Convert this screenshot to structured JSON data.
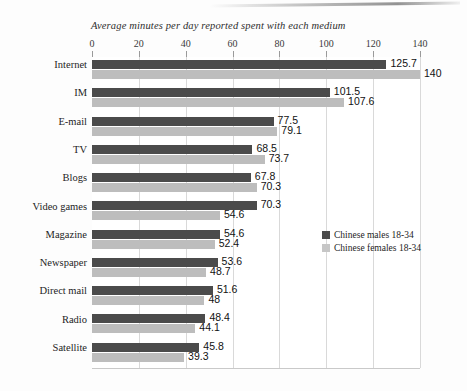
{
  "chart_data": {
    "type": "bar",
    "orientation": "horizontal",
    "title": "Average minutes per day reported spent with each medium",
    "xlabel": "",
    "ylabel": "",
    "xlim": [
      0,
      140
    ],
    "xticks": [
      0,
      20,
      40,
      60,
      80,
      100,
      120,
      140
    ],
    "grid": true,
    "legend_position": "center-right",
    "categories": [
      "Internet",
      "IM",
      "E-mail",
      "TV",
      "Blogs",
      "Video games",
      "Magazine",
      "Newspaper",
      "Direct mail",
      "Radio",
      "Satellite"
    ],
    "series": [
      {
        "name": "Chinese males 18-34",
        "color": "#4b4b4b",
        "values": [
          125.7,
          101.5,
          77.5,
          68.5,
          67.8,
          70.3,
          54.6,
          53.6,
          51.6,
          48.4,
          45.8
        ],
        "labels": [
          "125.7",
          "101.5",
          "77.5",
          "68.5",
          "67.8",
          "70.3",
          "54.6",
          "53.6",
          "51.6",
          "48.4",
          "45.8"
        ]
      },
      {
        "name": "Chinese females  18-34",
        "color": "#bdbdbd",
        "values": [
          140,
          107.6,
          79.1,
          73.7,
          70.3,
          54.6,
          52.4,
          48.7,
          48,
          44.1,
          39.3
        ],
        "labels": [
          "140",
          "107.6",
          "79.1",
          "73.7",
          "70.3",
          "54.6",
          "52.4",
          "48.7",
          "48",
          "44.1",
          "39.3"
        ]
      }
    ]
  },
  "legend": {
    "items": [
      {
        "label": "Chinese males 18-34",
        "color": "#4b4b4b"
      },
      {
        "label": "Chinese females  18-34",
        "color": "#c6c6c6"
      }
    ]
  }
}
